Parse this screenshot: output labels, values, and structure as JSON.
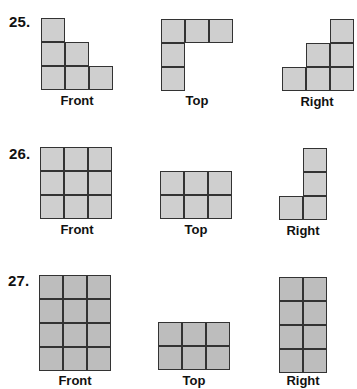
{
  "problems": [
    {
      "number": "25.",
      "views": [
        {
          "label": "Front",
          "cells": [
            [
              0,
              0
            ],
            [
              0,
              1
            ],
            [
              1,
              1
            ],
            [
              0,
              2
            ],
            [
              1,
              2
            ],
            [
              2,
              2
            ]
          ]
        },
        {
          "label": "Top",
          "cells": [
            [
              0,
              0
            ],
            [
              1,
              0
            ],
            [
              2,
              0
            ],
            [
              0,
              1
            ],
            [
              0,
              2
            ]
          ]
        },
        {
          "label": "Right",
          "cells": [
            [
              2,
              0
            ],
            [
              1,
              1
            ],
            [
              2,
              1
            ],
            [
              0,
              2
            ],
            [
              1,
              2
            ],
            [
              2,
              2
            ]
          ]
        }
      ]
    },
    {
      "number": "26.",
      "views": [
        {
          "label": "Front",
          "cells": [
            [
              0,
              0
            ],
            [
              1,
              0
            ],
            [
              2,
              0
            ],
            [
              0,
              1
            ],
            [
              1,
              1
            ],
            [
              2,
              1
            ],
            [
              0,
              2
            ],
            [
              1,
              2
            ],
            [
              2,
              2
            ]
          ]
        },
        {
          "label": "Top",
          "cells": [
            [
              0,
              0
            ],
            [
              1,
              0
            ],
            [
              2,
              0
            ],
            [
              0,
              1
            ],
            [
              1,
              1
            ],
            [
              2,
              1
            ]
          ]
        },
        {
          "label": "Right",
          "cells": [
            [
              1,
              0
            ],
            [
              1,
              1
            ],
            [
              0,
              2
            ],
            [
              1,
              2
            ]
          ]
        }
      ]
    },
    {
      "number": "27.",
      "views": [
        {
          "label": "Front",
          "cells": [
            [
              0,
              0
            ],
            [
              1,
              0
            ],
            [
              2,
              0
            ],
            [
              0,
              1
            ],
            [
              1,
              1
            ],
            [
              2,
              1
            ],
            [
              0,
              2
            ],
            [
              1,
              2
            ],
            [
              2,
              2
            ],
            [
              0,
              3
            ],
            [
              1,
              3
            ],
            [
              2,
              3
            ]
          ]
        },
        {
          "label": "Top",
          "cells": [
            [
              0,
              0
            ],
            [
              1,
              0
            ],
            [
              2,
              0
            ],
            [
              0,
              1
            ],
            [
              1,
              1
            ],
            [
              2,
              1
            ]
          ]
        },
        {
          "label": "Right",
          "cells": [
            [
              0,
              0
            ],
            [
              1,
              0
            ],
            [
              0,
              1
            ],
            [
              1,
              1
            ],
            [
              0,
              2
            ],
            [
              1,
              2
            ],
            [
              0,
              3
            ],
            [
              1,
              3
            ]
          ]
        }
      ]
    }
  ],
  "colors": {
    "cell_fill": "#cfcfcf",
    "cell_fill_dark": "#bdbdbd",
    "grid_line": "#333333",
    "text": "#111111"
  }
}
